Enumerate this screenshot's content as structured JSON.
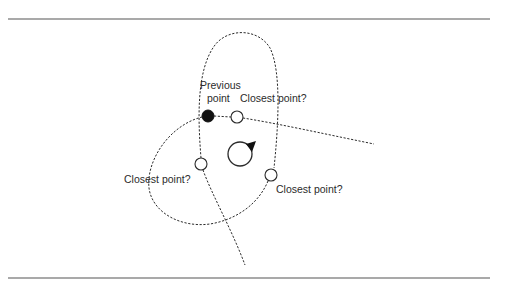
{
  "diagram": {
    "labels": {
      "previous_point_line1": "Previous",
      "previous_point_line2": "point",
      "closest_point_top": "Closest point?",
      "closest_point_left": "Closest point?",
      "closest_point_right": "Closest point?"
    },
    "colors": {
      "stroke": "#2b2b2b",
      "rule": "#8c8c8c",
      "filled_point": "#111111",
      "background": "#ffffff"
    },
    "points": {
      "previous": {
        "x": 208,
        "y": 116,
        "type": "filled"
      },
      "candidate_top": {
        "x": 237,
        "y": 117,
        "type": "open"
      },
      "candidate_left": {
        "x": 201,
        "y": 164,
        "type": "open"
      },
      "candidate_right": {
        "x": 271,
        "y": 175,
        "type": "open"
      },
      "robot": {
        "x": 240,
        "y": 153,
        "type": "robot-with-heading"
      }
    }
  }
}
